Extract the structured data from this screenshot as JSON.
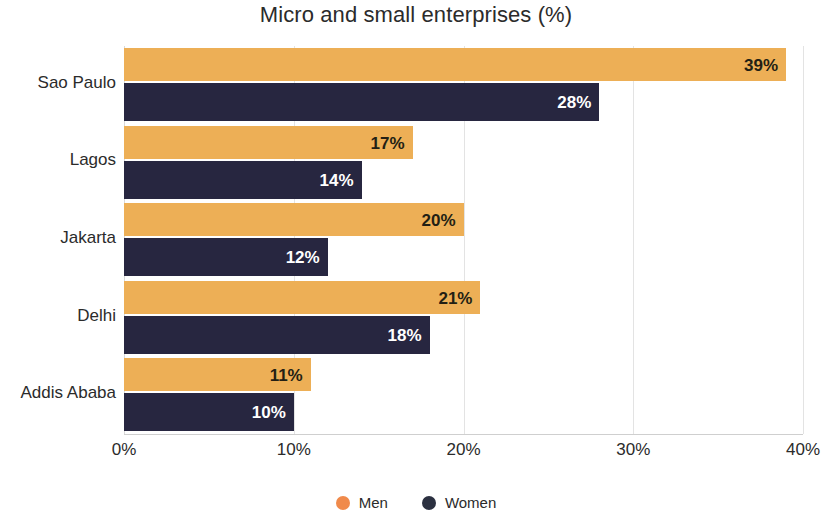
{
  "chart_data": {
    "type": "bar",
    "orientation": "horizontal",
    "title": "Micro and small enterprises (%)",
    "xlabel": "",
    "ylabel": "",
    "categories": [
      "Sao Paulo",
      "Lagos",
      "Jakarta",
      "Delhi",
      "Addis Ababa"
    ],
    "series": [
      {
        "name": "Men",
        "color": "#edaf56",
        "legend_color": "#f08a4b",
        "values": [
          39,
          17,
          20,
          21,
          11
        ],
        "labels": [
          "39%",
          "17%",
          "20%",
          "21%",
          "11%"
        ]
      },
      {
        "name": "Women",
        "color": "#272640",
        "legend_color": "#2b3040",
        "values": [
          28,
          14,
          12,
          18,
          10
        ],
        "labels": [
          "28%",
          "14%",
          "12%",
          "18%",
          "10%"
        ]
      }
    ],
    "xticks": [
      0,
      10,
      20,
      30,
      40
    ],
    "xtick_labels": [
      "0%",
      "10%",
      "20%",
      "30%",
      "40%"
    ],
    "xlim": [
      0,
      40
    ],
    "grid": true,
    "legend_position": "bottom"
  },
  "legend": {
    "items": [
      {
        "label": "Men",
        "color": "#f08a4b"
      },
      {
        "label": "Women",
        "color": "#2b3040"
      }
    ]
  }
}
